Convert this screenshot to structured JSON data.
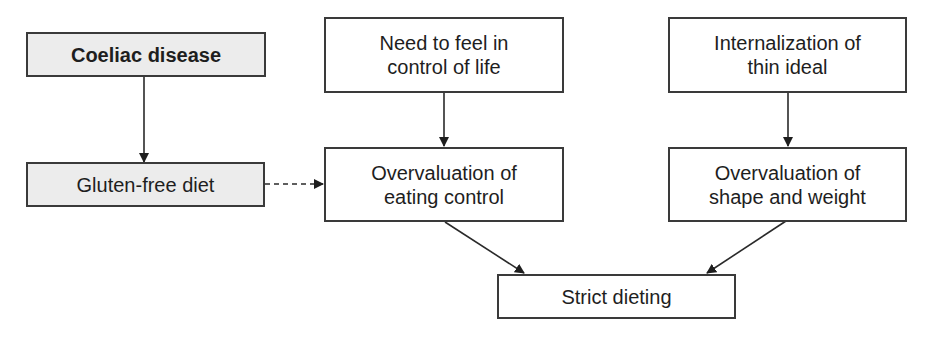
{
  "diagram": {
    "type": "flowchart",
    "nodes": [
      {
        "id": "coeliac",
        "label": "Coeliac disease",
        "style": "shaded-bold"
      },
      {
        "id": "gluten",
        "label": "Gluten-free diet",
        "style": "shaded"
      },
      {
        "id": "need_control",
        "label": "Need to feel in\ncontrol of life",
        "style": "plain"
      },
      {
        "id": "over_eating",
        "label": "Overvaluation of\neating control",
        "style": "plain"
      },
      {
        "id": "thin_ideal",
        "label": "Internalization of\nthin ideal",
        "style": "plain"
      },
      {
        "id": "over_shape",
        "label": "Overvaluation of\nshape and weight",
        "style": "plain"
      },
      {
        "id": "strict",
        "label": "Strict dieting",
        "style": "plain"
      }
    ],
    "edges": [
      {
        "from": "coeliac",
        "to": "gluten",
        "style": "solid"
      },
      {
        "from": "gluten",
        "to": "over_eating",
        "style": "dashed"
      },
      {
        "from": "need_control",
        "to": "over_eating",
        "style": "solid"
      },
      {
        "from": "thin_ideal",
        "to": "over_shape",
        "style": "solid"
      },
      {
        "from": "over_eating",
        "to": "strict",
        "style": "solid"
      },
      {
        "from": "over_shape",
        "to": "strict",
        "style": "solid"
      }
    ],
    "colors": {
      "line": "#2a2a2a",
      "shaded_fill": "#ececec",
      "border": "#3a3a3a"
    }
  }
}
